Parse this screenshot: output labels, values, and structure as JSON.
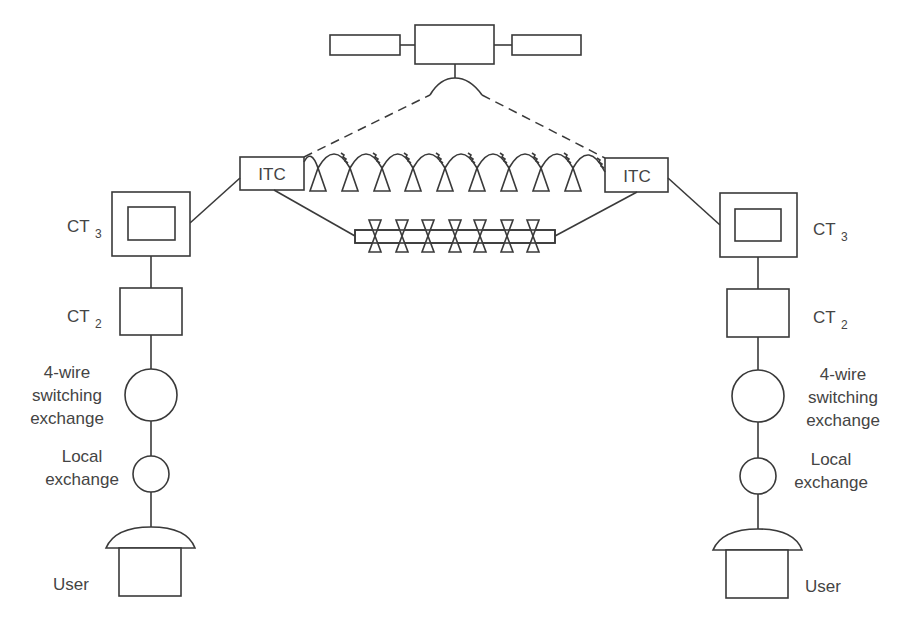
{
  "diagram": {
    "satellite": {
      "label": ""
    },
    "itc_left": {
      "label": "ITC"
    },
    "itc_right": {
      "label": "ITC"
    },
    "left_chain": {
      "ct3": {
        "main": "CT",
        "sub": "3"
      },
      "ct2": {
        "main": "CT",
        "sub": "2"
      },
      "four_wire": {
        "lines": [
          "4-wire",
          "switching",
          "exchange"
        ]
      },
      "local": {
        "lines": [
          "Local",
          "exchange"
        ]
      },
      "user": {
        "label": "User"
      }
    },
    "right_chain": {
      "ct3": {
        "main": "CT",
        "sub": "3"
      },
      "ct2": {
        "main": "CT",
        "sub": "2"
      },
      "four_wire": {
        "lines": [
          "4-wire",
          "switching",
          "exchange"
        ]
      },
      "local": {
        "lines": [
          "Local",
          "exchange"
        ]
      },
      "user": {
        "label": "User"
      }
    },
    "links": {
      "satellite_link": "dashed",
      "radio_relay_towers": 9,
      "cable_repeaters": 7
    },
    "colors": {
      "stroke": "#3a3a3a",
      "text": "#444444",
      "background": "#ffffff"
    }
  }
}
